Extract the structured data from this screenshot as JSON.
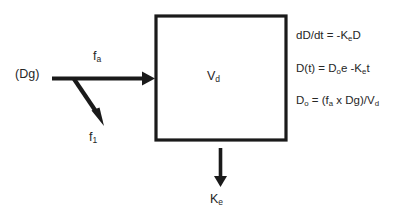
{
  "diagram": {
    "background_color": "#ffffff",
    "stroke_color": "#1a1a1a",
    "text_color": "#262626",
    "nodes": {
      "dose_source": {
        "label": "(Dg)",
        "meaning": "administered dose in gut"
      },
      "compartment": {
        "label_prefix": "V",
        "label_sub": "d",
        "meaning": "volume of distribution compartment",
        "shape": "rectangle"
      }
    },
    "arrows": {
      "absorption": {
        "label_prefix": "f",
        "label_sub": "a",
        "meaning": "fraction absorbed",
        "direction": "right"
      },
      "loss": {
        "label_prefix": "f",
        "label_sub": "1",
        "meaning": "fraction not absorbed",
        "direction": "down-right diagonal"
      },
      "elimination": {
        "label_prefix": "K",
        "label_sub": "e",
        "meaning": "elimination rate constant",
        "direction": "down"
      }
    },
    "equations": [
      {
        "id": "rate-of-change",
        "parts": [
          {
            "t": "dD/dt = -K"
          },
          {
            "t": "e",
            "sub": true
          },
          {
            "t": "D"
          }
        ]
      },
      {
        "id": "exponential-decay",
        "parts": [
          {
            "t": "D(t) = D"
          },
          {
            "t": "o",
            "sub": true
          },
          {
            "t": "e -K"
          },
          {
            "t": "e",
            "sub": true
          },
          {
            "t": "t"
          }
        ]
      },
      {
        "id": "initial-concentration",
        "parts": [
          {
            "t": "D"
          },
          {
            "t": "o",
            "sub": true
          },
          {
            "t": " = (f"
          },
          {
            "t": "a",
            "sub": true
          },
          {
            "t": " x Dg)/V"
          },
          {
            "t": "d",
            "sub": true
          }
        ]
      }
    ]
  }
}
